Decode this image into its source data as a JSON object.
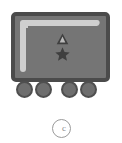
{
  "graphic": {
    "title": "wagon-pictogram",
    "background_color": "#ffffff",
    "vehicle": {
      "name": "wagon",
      "body": {
        "fill_color": "#757575",
        "border_color": "#4b4b4b",
        "highlight_color": "#cfcfcf"
      },
      "symbols": [
        {
          "name": "warning-triangle-icon",
          "glyph": "triangle",
          "color": "#3f3f3f"
        },
        {
          "name": "star-icon",
          "glyph": "star",
          "color": "#3f3f3f"
        }
      ],
      "wheels": {
        "count": 4,
        "fill_color": "#6e6e6e",
        "border_color": "#4f4f4f",
        "labels": [
          "wheel-1",
          "wheel-2",
          "wheel-3",
          "wheel-4"
        ]
      }
    },
    "badge": {
      "name": "circle-badge",
      "glyph": "c",
      "outline_color": "#9a9a9a",
      "glyph_color": "#8a8a8a"
    }
  }
}
